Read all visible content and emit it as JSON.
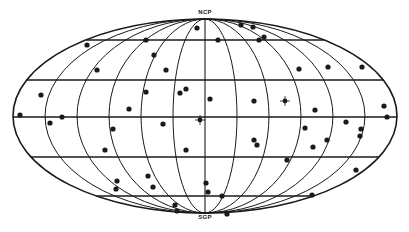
{
  "figure": {
    "projection": "all-sky equal-area (Aitoff-type) galactic projection",
    "labels": {
      "north_pole": "NCP",
      "south_pole": "SGP"
    },
    "colors": {
      "ink": "#1a1a1a",
      "background": "#ffffff"
    },
    "geometry": {
      "cx": 205,
      "cy": 116,
      "a": 192,
      "b": 97
    },
    "meridian_fractions": [
      0.1667,
      0.3333,
      0.5,
      0.6667,
      0.8333
    ],
    "parallel_ys": [
      40,
      80,
      117,
      157,
      196
    ]
  },
  "points": [
    [
      87,
      45
    ],
    [
      146,
      40
    ],
    [
      154,
      55
    ],
    [
      97,
      70
    ],
    [
      166,
      70
    ],
    [
      197,
      28
    ],
    [
      218,
      40
    ],
    [
      241,
      25
    ],
    [
      253,
      27
    ],
    [
      259,
      40
    ],
    [
      264,
      37
    ],
    [
      299,
      69
    ],
    [
      328,
      67
    ],
    [
      362,
      67
    ],
    [
      41,
      95
    ],
    [
      20,
      115
    ],
    [
      50,
      123
    ],
    [
      62,
      117
    ],
    [
      129,
      109
    ],
    [
      113,
      129
    ],
    [
      105,
      150
    ],
    [
      146,
      92
    ],
    [
      180,
      93
    ],
    [
      186,
      89
    ],
    [
      163,
      124
    ],
    [
      210,
      99
    ],
    [
      254,
      101
    ],
    [
      315,
      110
    ],
    [
      384,
      106
    ],
    [
      387,
      117
    ],
    [
      305,
      128
    ],
    [
      346,
      122
    ],
    [
      361,
      129
    ],
    [
      360,
      136
    ],
    [
      254,
      140
    ],
    [
      257,
      145
    ],
    [
      313,
      147
    ],
    [
      327,
      140
    ],
    [
      186,
      150
    ],
    [
      287,
      160
    ],
    [
      356,
      170
    ],
    [
      117,
      181
    ],
    [
      116,
      189
    ],
    [
      148,
      176
    ],
    [
      153,
      187
    ],
    [
      206,
      183
    ],
    [
      208,
      192
    ],
    [
      222,
      196
    ],
    [
      175,
      205
    ],
    [
      177,
      211
    ],
    [
      312,
      195
    ],
    [
      227,
      214
    ]
  ],
  "special_points": [
    {
      "x": 285,
      "y": 101,
      "type": "cross"
    },
    {
      "x": 200,
      "y": 120,
      "type": "cross"
    }
  ]
}
